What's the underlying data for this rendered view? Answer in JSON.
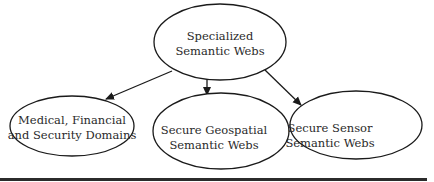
{
  "diagram": {
    "root": {
      "line1": "Specialized",
      "line2": "Semantic Webs"
    },
    "children": [
      {
        "line1": "Medical, Financial",
        "line2": "and Security Domains"
      },
      {
        "line1": "Secure Geospatial",
        "line2": "Semantic Webs"
      },
      {
        "line1": "Secure Sensor",
        "line2": "Semantic Webs"
      }
    ],
    "edges": [
      {
        "from": "Specialized Semantic Webs",
        "to": "Medical, Financial and Security Domains"
      },
      {
        "from": "Specialized Semantic Webs",
        "to": "Secure Geospatial Semantic Webs"
      },
      {
        "from": "Specialized Semantic Webs",
        "to": "Secure Sensor Semantic Webs"
      }
    ],
    "colors": {
      "stroke": "#1a1a1a",
      "text": "#2a2a2a",
      "rule": "#2b2b2b"
    }
  }
}
